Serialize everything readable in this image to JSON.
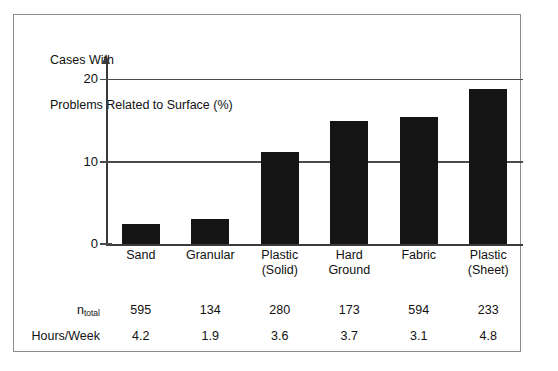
{
  "chart_data": {
    "type": "bar",
    "title": "Cases With Problems Related to Surface (%)",
    "title_lines": [
      "Cases With",
      "Problems Related to Surface (%)"
    ],
    "categories": [
      "Sand",
      "Granular",
      "Plastic (Solid)",
      "Hard Ground",
      "Fabric",
      "Plastic (Sheet)"
    ],
    "category_lines": [
      [
        "Sand"
      ],
      [
        "Granular"
      ],
      [
        "Plastic",
        "(Solid)"
      ],
      [
        "Hard",
        "Ground"
      ],
      [
        "Fabric"
      ],
      [
        "Plastic",
        "(Sheet)"
      ]
    ],
    "values": [
      2.4,
      3.1,
      11.2,
      15.0,
      15.4,
      18.8
    ],
    "xlabel": "",
    "ylabel": "Cases With Problems Related to Surface (%)",
    "ylim": [
      0,
      22
    ],
    "yticks": [
      0,
      10,
      20
    ],
    "ytick_labels": [
      "0",
      "10",
      "20"
    ],
    "grid": true,
    "legend": false,
    "bar_color": "#141414",
    "axis_color": "#3a3a3a",
    "grid_color": "#4a4a4a",
    "table": {
      "rows": [
        {
          "label": "n",
          "label_sub": "total",
          "values": [
            "595",
            "134",
            "280",
            "173",
            "594",
            "233"
          ]
        },
        {
          "label": "Hours/Week",
          "label_sub": "",
          "values": [
            "4.2",
            "1.9",
            "3.6",
            "3.7",
            "3.1",
            "4.8"
          ]
        }
      ]
    }
  }
}
